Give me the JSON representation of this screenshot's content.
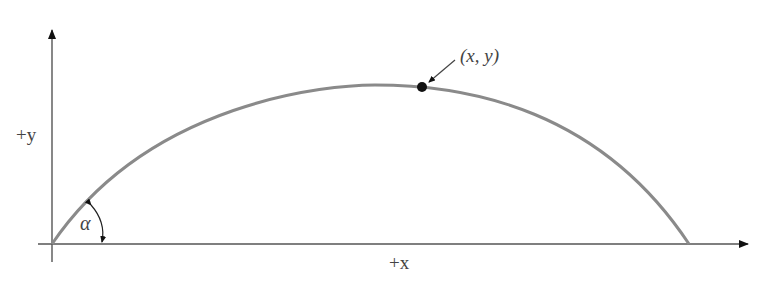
{
  "diagram": {
    "type": "projectile-trajectory",
    "colors": {
      "axis": "#555555",
      "trajectory": "#8a8a8a",
      "point": "#111111",
      "text": "#444444"
    },
    "labels": {
      "y_axis": "+y",
      "x_axis": "+x",
      "angle": "α",
      "point": "(x, y)"
    }
  }
}
